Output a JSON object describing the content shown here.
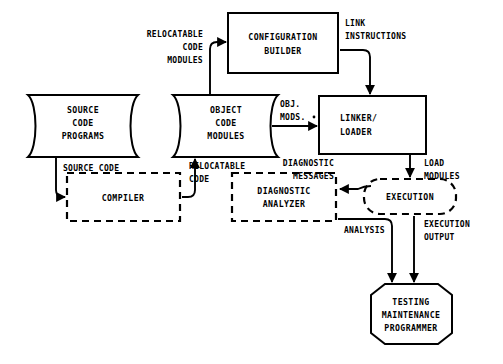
{
  "diagram": {
    "type": "data-flow-diagram",
    "background_color": "#ffffff",
    "line_color": "#000000",
    "nodes": [
      {
        "id": "source-code-programs",
        "shape": "magnetic-tape",
        "style": "solid",
        "lines": [
          "SOURCE",
          "CODE",
          "PROGRAMS"
        ]
      },
      {
        "id": "object-code-modules",
        "shape": "magnetic-tape",
        "style": "solid",
        "lines": [
          "OBJECT",
          "CODE",
          "MODULES"
        ]
      },
      {
        "id": "configuration-builder",
        "shape": "rectangle",
        "style": "solid",
        "lines": [
          "CONFIGURATION",
          "BUILDER"
        ]
      },
      {
        "id": "linker-loader",
        "shape": "rectangle",
        "style": "solid",
        "lines": [
          "LINKER/",
          "LOADER"
        ]
      },
      {
        "id": "compiler",
        "shape": "rectangle",
        "style": "dashed",
        "lines": [
          "COMPILER"
        ]
      },
      {
        "id": "diagnostic-analyzer",
        "shape": "rectangle",
        "style": "dashed",
        "lines": [
          "DIAGNOSTIC",
          "ANALYZER"
        ]
      },
      {
        "id": "execution",
        "shape": "rounded-rectangle",
        "style": "dashed",
        "lines": [
          "EXECUTION"
        ]
      },
      {
        "id": "testing-maintenance-programmer",
        "shape": "hexagon",
        "style": "solid",
        "lines": [
          "TESTING",
          "MAINTENANCE",
          "PROGRAMMER"
        ]
      }
    ],
    "edges": [
      {
        "id": "relocatable-code-modules",
        "from": "object-code-modules",
        "to": "configuration-builder",
        "lines": [
          "RELOCATABLE",
          "CODE",
          "MODULES"
        ]
      },
      {
        "id": "link-instructions",
        "from": "configuration-builder",
        "to": "linker-loader",
        "lines": [
          "LINK",
          "INSTRUCTIONS"
        ]
      },
      {
        "id": "obj-mods",
        "from": "object-code-modules",
        "to": "linker-loader",
        "lines": [
          "OBJ.",
          "MODS."
        ]
      },
      {
        "id": "source-code",
        "from": "source-code-programs",
        "to": "compiler",
        "lines": [
          "SOURCE CODE"
        ]
      },
      {
        "id": "relocatable-code",
        "from": "compiler",
        "to": "object-code-modules",
        "lines": [
          "RELOCATABLE",
          "CODE"
        ]
      },
      {
        "id": "diagnostic-messages",
        "from": "execution",
        "to": "diagnostic-analyzer",
        "lines": [
          "DIAGNOSTIC",
          "MESSAGES"
        ]
      },
      {
        "id": "load-modules",
        "from": "linker-loader",
        "to": "execution",
        "lines": [
          "LOAD",
          "MODULES"
        ]
      },
      {
        "id": "analysis",
        "from": "diagnostic-analyzer",
        "to": "testing-maintenance-programmer",
        "lines": [
          "ANALYSIS"
        ]
      },
      {
        "id": "execution-output",
        "from": "execution",
        "to": "testing-maintenance-programmer",
        "lines": [
          "EXECUTION",
          "OUTPUT"
        ]
      }
    ]
  }
}
